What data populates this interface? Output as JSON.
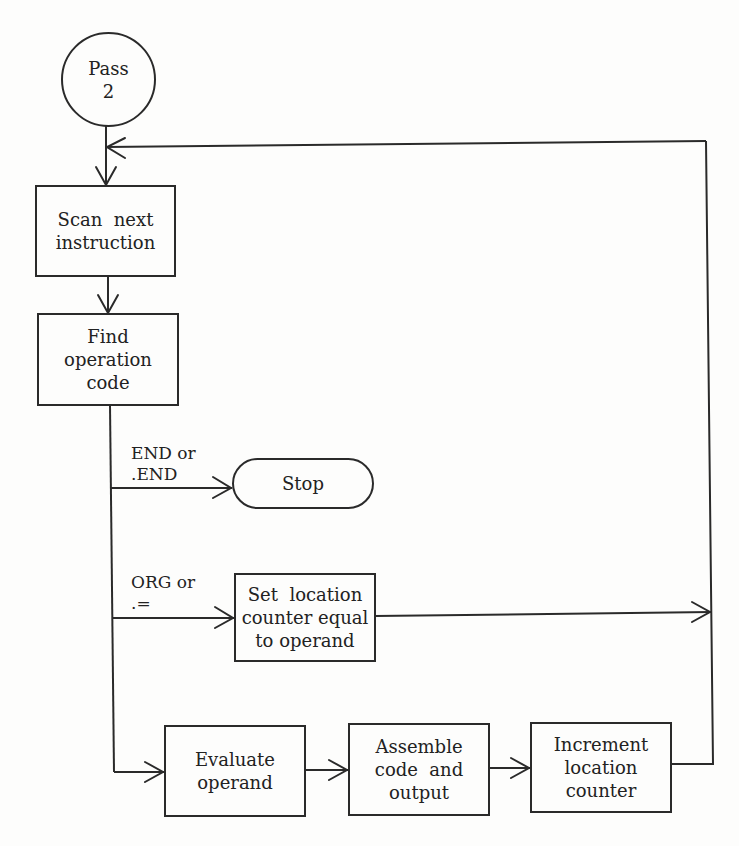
{
  "diagram": {
    "type": "flowchart",
    "nodes": {
      "start": {
        "line1": "Pass",
        "line2": "2",
        "shape": "circle"
      },
      "scan": {
        "line1": "Scan  next",
        "line2": "instruction",
        "shape": "process"
      },
      "find": {
        "line1": "Find",
        "line2": "operation",
        "line3": "code",
        "shape": "process"
      },
      "stop": {
        "line1": "Stop",
        "shape": "terminal"
      },
      "set_location": {
        "line1": "Set  location",
        "line2": "counter equal",
        "line3": "to operand",
        "shape": "process"
      },
      "evaluate": {
        "line1": "Evaluate",
        "line2": "operand",
        "shape": "process"
      },
      "assemble": {
        "line1": "Assemble",
        "line2": "code  and",
        "line3": "output",
        "shape": "process"
      },
      "increment": {
        "line1": "Increment",
        "line2": "location",
        "line3": "counter",
        "shape": "process"
      }
    },
    "branch_labels": {
      "end": {
        "line1": "END or",
        "line2": ".END"
      },
      "org": {
        "line1": "ORG or",
        "line2": ".="
      }
    },
    "edges": [
      {
        "from": "start",
        "to": "scan"
      },
      {
        "from": "scan",
        "to": "find"
      },
      {
        "from": "find",
        "to": "stop",
        "label": "END or .END"
      },
      {
        "from": "find",
        "to": "set_location",
        "label": "ORG or .="
      },
      {
        "from": "find",
        "to": "evaluate"
      },
      {
        "from": "evaluate",
        "to": "assemble"
      },
      {
        "from": "assemble",
        "to": "increment"
      },
      {
        "from": "increment",
        "to": "scan",
        "note": "loop back"
      },
      {
        "from": "set_location",
        "to": "scan",
        "note": "joins loop back"
      }
    ],
    "colors": {
      "ink": "#2a2a2a",
      "background": "#fdfdfc"
    }
  }
}
